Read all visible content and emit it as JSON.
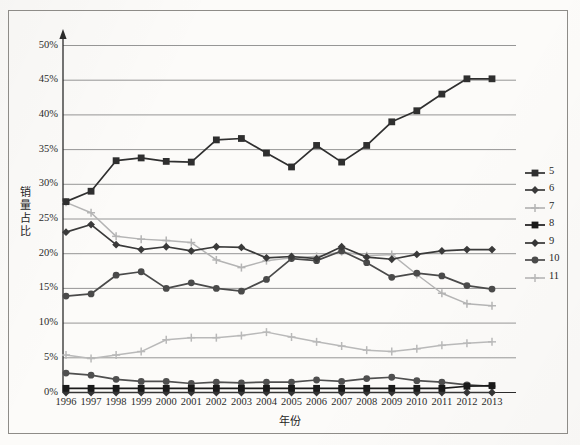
{
  "chart_data": {
    "type": "line",
    "title": "",
    "xlabel": "年份",
    "ylabel": "销量占比",
    "x": [
      "1996",
      "1997",
      "1998",
      "1999",
      "2000",
      "2001",
      "2002",
      "2003",
      "2004",
      "2005",
      "2006",
      "2007",
      "2008",
      "2009",
      "2010",
      "2011",
      "2012",
      "2013"
    ],
    "categories": [
      "1996",
      "1997",
      "1998",
      "1999",
      "2000",
      "2001",
      "2002",
      "2003",
      "2004",
      "2005",
      "2006",
      "2007",
      "2008",
      "2009",
      "2010",
      "2011",
      "2012",
      "2013"
    ],
    "ylim": [
      0,
      50
    ],
    "yticks": [
      "0%",
      "5%",
      "10%",
      "15%",
      "20%",
      "25%",
      "30%",
      "35%",
      "40%",
      "45%",
      "50%"
    ],
    "ytick_values": [
      0,
      5,
      10,
      15,
      20,
      25,
      30,
      35,
      40,
      45,
      50
    ],
    "grid": true,
    "legend_position": "right",
    "series": [
      {
        "name": "5",
        "color": "#2f2f2f",
        "marker": "square",
        "values": [
          27.5,
          29.0,
          33.4,
          33.8,
          33.3,
          33.2,
          36.4,
          36.6,
          34.5,
          32.5,
          35.6,
          33.2,
          35.6,
          39.0,
          40.6,
          43.0,
          45.2,
          45.2
        ]
      },
      {
        "name": "6",
        "color": "#3a3a3a",
        "marker": "diamond",
        "values": [
          23.1,
          24.2,
          21.3,
          20.6,
          21.0,
          20.4,
          21.0,
          20.9,
          19.4,
          19.6,
          19.3,
          21.0,
          19.5,
          19.2,
          19.9,
          20.4,
          20.6,
          20.6
        ]
      },
      {
        "name": "7",
        "color": "#b4b4b4",
        "marker": "plus",
        "values": [
          27.4,
          25.9,
          22.5,
          22.1,
          21.9,
          21.6,
          19.1,
          18.0,
          19.0,
          19.4,
          19.6,
          20.3,
          19.7,
          19.9,
          17.0,
          14.3,
          12.8,
          12.5
        ]
      },
      {
        "name": "8",
        "color": "#1a1a1a",
        "marker": "square",
        "values": [
          0.6,
          0.6,
          0.6,
          0.6,
          0.6,
          0.6,
          0.6,
          0.6,
          0.6,
          0.6,
          0.6,
          0.6,
          0.6,
          0.6,
          0.6,
          0.6,
          0.9,
          1.0
        ]
      },
      {
        "name": "9",
        "color": "#353535",
        "marker": "diamond",
        "values": [
          0.0,
          0.0,
          0.0,
          0.0,
          0.0,
          0.0,
          0.0,
          0.0,
          0.0,
          0.0,
          0.0,
          0.0,
          0.0,
          0.0,
          0.0,
          0.0,
          0.0,
          0.0
        ]
      },
      {
        "name": "10",
        "color": "#4a4a4a",
        "marker": "circle",
        "values": [
          13.9,
          14.2,
          16.9,
          17.4,
          15.0,
          15.8,
          15.0,
          14.6,
          16.3,
          19.3,
          19.0,
          20.4,
          18.7,
          16.6,
          17.2,
          16.8,
          15.4,
          14.9
        ]
      },
      {
        "name": "11",
        "color": "#b9b9b9",
        "marker": "plus",
        "values": [
          5.4,
          4.9,
          5.4,
          5.9,
          7.6,
          7.9,
          7.9,
          8.2,
          8.7,
          8.0,
          7.3,
          6.7,
          6.1,
          5.9,
          6.3,
          6.8,
          7.1,
          7.3
        ]
      },
      {
        "name": "10b",
        "color": "#4f4f4f",
        "marker": "circle",
        "values": [
          2.8,
          2.5,
          1.9,
          1.6,
          1.6,
          1.3,
          1.5,
          1.4,
          1.5,
          1.5,
          1.8,
          1.6,
          2.0,
          2.2,
          1.7,
          1.5,
          1.1,
          0.9
        ]
      }
    ],
    "legend_entries": [
      {
        "label": "5",
        "color": "#2f2f2f",
        "marker": "square"
      },
      {
        "label": "6",
        "color": "#3a3a3a",
        "marker": "diamond"
      },
      {
        "label": "7",
        "color": "#b4b4b4",
        "marker": "plus"
      },
      {
        "label": "8",
        "color": "#1a1a1a",
        "marker": "square"
      },
      {
        "label": "9",
        "color": "#353535",
        "marker": "diamond"
      },
      {
        "label": "10",
        "color": "#4a4a4a",
        "marker": "circle"
      },
      {
        "label": "11",
        "color": "#b9b9b9",
        "marker": "plus"
      }
    ]
  }
}
